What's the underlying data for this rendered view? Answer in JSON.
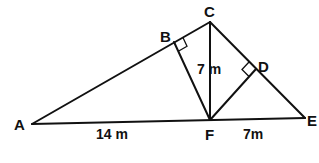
{
  "diagram": {
    "points": {
      "A": {
        "label": "A",
        "x": 32,
        "y": 124
      },
      "B": {
        "label": "B",
        "x": 174,
        "y": 42
      },
      "C": {
        "label": "C",
        "x": 210,
        "y": 22
      },
      "D": {
        "label": "D",
        "x": 256,
        "y": 69
      },
      "E": {
        "label": "E",
        "x": 305,
        "y": 118
      },
      "F": {
        "label": "F",
        "x": 210,
        "y": 120
      }
    },
    "segments": [
      "AC",
      "AE",
      "CE",
      "CF",
      "BF",
      "DF"
    ],
    "right_angles": [
      "B",
      "D"
    ],
    "measurements": {
      "AF": "14 m",
      "CF": "7 m",
      "FE": "7m"
    }
  }
}
